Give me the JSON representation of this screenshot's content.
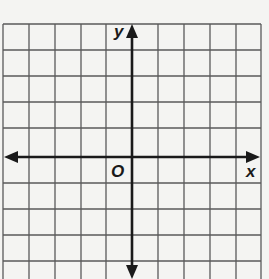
{
  "diagram": {
    "type": "coordinate-plane",
    "labels": {
      "x_axis": "x",
      "y_axis": "y",
      "origin": "O"
    },
    "grid": {
      "columns": 10,
      "rows": 10,
      "cell_size_px": 26,
      "origin_column": 5,
      "origin_row": 5,
      "show_grid": true
    },
    "colors": {
      "background": "#f4f4f2",
      "grid_line": "#555555",
      "axis": "#1a1a1a"
    }
  }
}
